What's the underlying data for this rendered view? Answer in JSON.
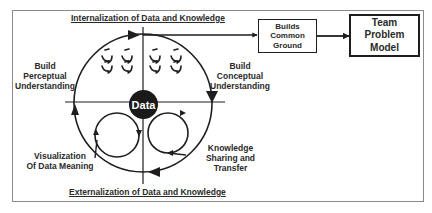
{
  "diagram": {
    "top_title": "Internalization of Data and Knowledge",
    "bottom_title": "Externalization of Data and Knowledge",
    "center_node": "Data",
    "quadrant_labels": {
      "top_left": "Build\nPerceptual\nUnderstanding",
      "top_right": "Build\nConceptual\nUnderstanding",
      "bottom_left": "Visualization\nOf Data Meaning",
      "bottom_right": "Knowledge\nSharing and\nTransfer"
    },
    "flow_boxes": [
      {
        "label": "Builds\nCommon\nGround"
      },
      {
        "label": "Team\nProblem\nModel"
      }
    ],
    "colors": {
      "line": "#1e1e1e",
      "text": "#2a2a2a",
      "frame": "#8a8a8a",
      "node_fill": "#1a1a1a",
      "background": "#ffffff"
    }
  }
}
